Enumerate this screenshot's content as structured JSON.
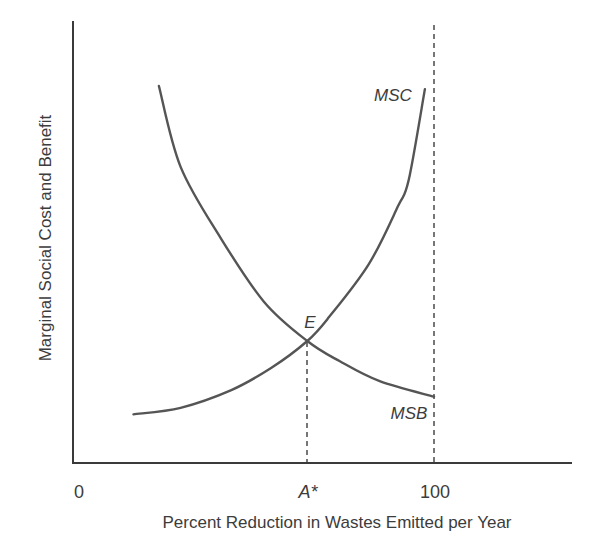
{
  "chart_data": {
    "type": "line",
    "title": "",
    "xlabel": "Percent Reduction in Wastes Emitted per Year",
    "ylabel": "Marginal Social Cost and Benefit",
    "x_ticks": [
      "0",
      "A*",
      "100"
    ],
    "x_tick_values": [
      0,
      65,
      100
    ],
    "xlim": [
      0,
      138
    ],
    "ylim": [
      0,
      100
    ],
    "y_units": "unlabeled (normalized 0-100 by axis height)",
    "grid": false,
    "legend": "none (curves labeled directly)",
    "series": [
      {
        "name": "MSC",
        "description": "Marginal social cost of waste reduction, rising",
        "x": [
          17,
          30,
          44,
          55,
          65,
          71,
          82,
          90,
          93,
          97.5
        ],
        "y": [
          11,
          12.5,
          16.5,
          21.5,
          27.6,
          33,
          45,
          58,
          64,
          84.6
        ]
      },
      {
        "name": "MSB",
        "description": "Marginal social benefit of waste reduction, falling",
        "x": [
          24,
          30,
          41,
          53,
          65,
          74,
          85,
          100
        ],
        "y": [
          85.3,
          67,
          51,
          36.5,
          27.6,
          23,
          18.5,
          15
        ]
      }
    ],
    "annotations": [
      {
        "text": "E",
        "x": 65,
        "y": 27.6,
        "note": "equilibrium: MSC = MSB"
      },
      {
        "text": "A*",
        "type": "dashed vertical from E to x-axis",
        "x": 65
      },
      {
        "text": "100",
        "type": "dashed vertical line at 100% reduction",
        "x": 100
      }
    ]
  },
  "labels": {
    "y_axis": "Marginal Social Cost and Benefit",
    "x_axis": "Percent Reduction in Wastes Emitted per Year",
    "tick_0": "0",
    "tick_astar": "A*",
    "tick_100": "100",
    "msc": "MSC",
    "msb": "MSB",
    "e": "E"
  },
  "colors": {
    "curve": "#555555",
    "axis": "#3a3a3a",
    "text": "#3c3c3c",
    "background": "#ffffff"
  }
}
